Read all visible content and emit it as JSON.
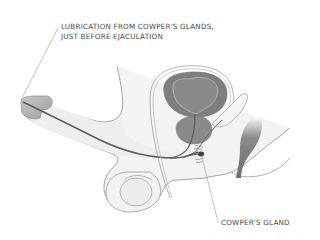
{
  "diagram": {
    "labels": {
      "lubrication_line1": "LUBRICATION FROM COWPER'S GLANDS,",
      "lubrication_line2": "JUST BEFORE EJACULATION",
      "cowpers_gland": "COWPER'S GLAND"
    },
    "colors": {
      "outline": "#9a9a9a",
      "body_fill": "#f1f1f1",
      "organ_dark": "#7d7d7d",
      "organ_mid": "#8c8c8c",
      "bladder_inner": "#888888",
      "urethra": "#5a5a5a",
      "text": "#4a4a4a",
      "leader_line": "#9a9a9a"
    }
  }
}
